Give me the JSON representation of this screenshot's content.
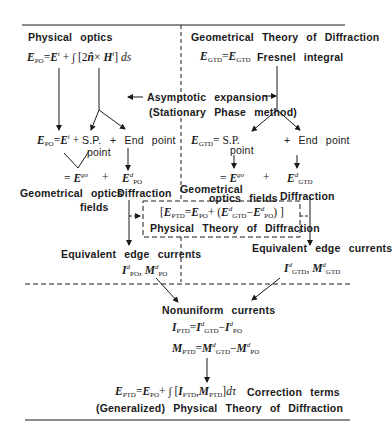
{
  "left_column": {
    "title": "Physical optics",
    "po_formula": "E_PO = E^i + ∫ [2n̂ × H^i] ds",
    "po_expansion": {
      "lhs": "E_PO = E^i +",
      "sp": "S.P.",
      "sp2": "point",
      "end": "+ End point"
    },
    "go_term": "= E^go",
    "plus": "+",
    "diff_term": "E^d_PO",
    "go_label": "Geometrical optics",
    "go_label2": "fields",
    "diff_label": "Diffraction",
    "eec_label": "Equivalent edge currents",
    "eec_values": "I^d_PO, M^d_PO"
  },
  "right_column": {
    "title": "Geometrical Theory of Diffraction",
    "gtd_formula": "E_GTD = E_GTD",
    "gtd_formula_note": "Fresnel integral",
    "gtd_expansion": {
      "lhs": "E_GTD = S.P.",
      "sp2": "point",
      "end": "+ End point"
    },
    "go_term": "= E^go",
    "plus": "+",
    "diff_term": "E^d_GTD",
    "go_label": "Geometrical",
    "go_label2": "optics fields",
    "diff_label": "Diffraction",
    "eec_label": "Equivalent edge currents",
    "eec_values": "I^d_GTD, M^d_GTD"
  },
  "center": {
    "asymptotic_label": "Asymptotic expansion",
    "asymptotic_sub": "(Stationary Phase method)",
    "ptd_box_formula": "[E_PTD = E_PO + (E^d_GTD − E^d_PO)]",
    "ptd_box_label": "Physical Theory of Diffraction"
  },
  "bottom": {
    "nonuniform_label": "Nonuniform currents",
    "i_ptd": "I_PTD = I^d_GTD − I^d_PO",
    "m_ptd": "M_PTD = M^d_GTD − M^d_PO",
    "final_formula": "E_PTD = E_PO + ∫ [I_PTD, M_PTD] dτ",
    "correction_label": "Correction terms",
    "final_label": "(Generalized) Physical Theory of Diffraction"
  },
  "colors": {
    "ink": "#1a1a1a",
    "background": "#ffffff"
  }
}
